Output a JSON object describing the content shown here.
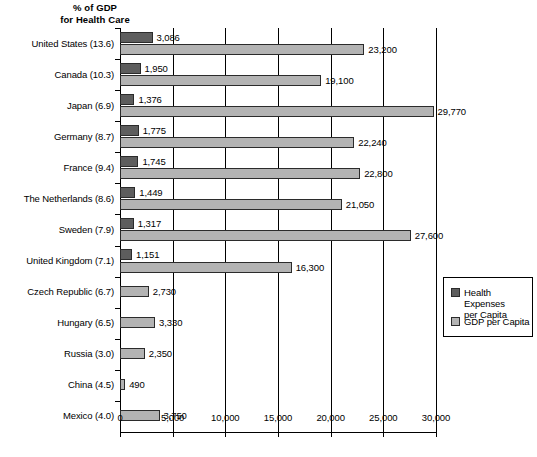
{
  "chart_data": {
    "type": "bar",
    "orientation": "horizontal",
    "title_lines": [
      "% of GDP",
      "for Health Care"
    ],
    "xlabel": "",
    "ylabel": "",
    "xlim": [
      0,
      30000
    ],
    "grid": true,
    "grid_axis": "x",
    "legend_position": "right-middle",
    "xticks": [
      0,
      5000,
      10000,
      15000,
      20000,
      25000,
      30000
    ],
    "xticklabels": [
      "0",
      "5,000",
      "10,000",
      "15,000",
      "20,000",
      "25,000",
      "30,000"
    ],
    "categories": [
      "United States (13.6)",
      "Canada (10.3)",
      "Japan (6.9)",
      "Germany (8.7)",
      "France (9.4)",
      "The Netherlands (8.6)",
      "Sweden (7.9)",
      "United Kingdom (7.1)",
      "Czech Republic (6.7)",
      "Hungary (6.5)",
      "Russia (3.0)",
      "China (4.5)",
      "Mexico (4.0)"
    ],
    "gdp_percent_health": [
      13.6,
      10.3,
      6.9,
      8.7,
      9.4,
      8.6,
      7.9,
      7.1,
      6.7,
      6.5,
      3.0,
      4.5,
      4.0
    ],
    "series": [
      {
        "name": "Health Expenses per Capita",
        "color": "#5d5d5d",
        "values": [
          3086,
          1950,
          1376,
          1775,
          1745,
          1449,
          1317,
          1151,
          null,
          null,
          null,
          null,
          null
        ],
        "labels": [
          "3,086",
          "1,950",
          "1,376",
          "1,775",
          "1,745",
          "1,449",
          "1,317",
          "1,151",
          "",
          "",
          "",
          "",
          ""
        ]
      },
      {
        "name": "GDP per Capita",
        "color": "#b3b3b3",
        "values": [
          23200,
          19100,
          29770,
          22240,
          22800,
          21050,
          27600,
          16300,
          2730,
          3330,
          2350,
          490,
          3750
        ],
        "labels": [
          "23,200",
          "19,100",
          "29,770",
          "22,240",
          "22,800",
          "21,050",
          "27,600",
          "16,300",
          "2,730",
          "3,330",
          "2,350",
          "490",
          "3,750"
        ]
      }
    ]
  },
  "legend": {
    "items": [
      {
        "label": "Health Expenses\nper Capita",
        "swatch": "health"
      },
      {
        "label": "GDP per Capita",
        "swatch": "gdp"
      }
    ]
  }
}
